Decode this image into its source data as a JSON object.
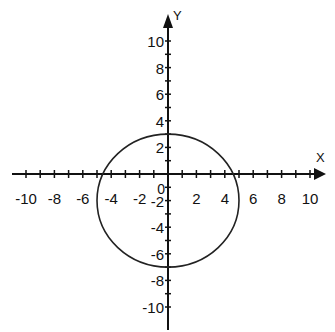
{
  "chart_data": {
    "type": "line",
    "title": "",
    "xlabel": "X",
    "ylabel": "Y",
    "xlim": [
      -10,
      10
    ],
    "ylim": [
      -10,
      10
    ],
    "grid": false,
    "x_tick_labels": [
      "-10",
      "-8",
      "-6",
      "-4",
      "-2",
      "2",
      "4",
      "6",
      "8",
      "10"
    ],
    "y_tick_labels": [
      "10",
      "8",
      "6",
      "4",
      "2",
      "-2",
      "-4",
      "-6",
      "-8",
      "-10"
    ],
    "origin_label": "0",
    "series": [
      {
        "name": "circle",
        "shape": "circle",
        "center": [
          0,
          -2
        ],
        "radius": 5,
        "equation": "x^2 + (y+2)^2 = 25",
        "key_points": [
          [
            0,
            3
          ],
          [
            0,
            -7
          ],
          [
            -5,
            -2
          ],
          [
            5,
            -2
          ]
        ]
      }
    ]
  },
  "axes": {
    "x_label": "X",
    "y_label": "Y"
  }
}
